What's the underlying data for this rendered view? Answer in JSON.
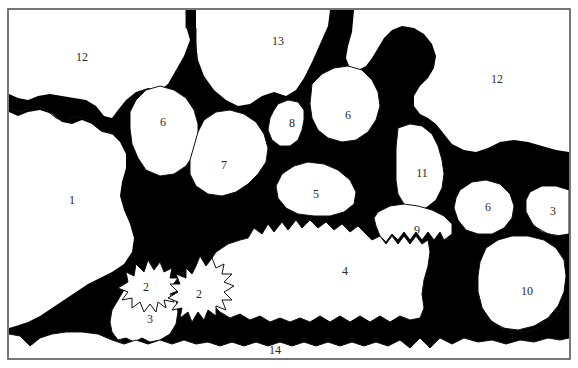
{
  "figure": {
    "width": 578,
    "height": 368,
    "colors": {
      "matrix": "#000000",
      "clast": "#ffffff",
      "outline": "#111111",
      "frame": "#555555",
      "label": "#2a2a2a"
    }
  },
  "frame": {
    "x": 8,
    "y": 9,
    "width": 562,
    "height": 350
  },
  "labels": [
    {
      "id": "label-12-left",
      "text": "12",
      "x": 82,
      "y": 58
    },
    {
      "id": "label-13",
      "text": "13",
      "x": 278,
      "y": 42
    },
    {
      "id": "label-12-right",
      "text": "12",
      "x": 497,
      "y": 80
    },
    {
      "id": "label-6-upper-left",
      "text": "6",
      "x": 163,
      "y": 123
    },
    {
      "id": "label-8",
      "text": "8",
      "x": 292,
      "y": 124
    },
    {
      "id": "label-6-upper-right",
      "text": "6",
      "x": 348,
      "y": 116
    },
    {
      "id": "label-7",
      "text": "7",
      "x": 224,
      "y": 166
    },
    {
      "id": "label-11",
      "text": "11",
      "x": 422,
      "y": 174
    },
    {
      "id": "label-1",
      "text": "1",
      "x": 72,
      "y": 201
    },
    {
      "id": "label-5",
      "text": "5",
      "x": 316,
      "y": 195
    },
    {
      "id": "label-6-right",
      "text": "6",
      "x": 488,
      "y": 208
    },
    {
      "id": "label-3-right",
      "text": "3",
      "x": 553,
      "y": 212
    },
    {
      "id": "label-9",
      "text": "9",
      "x": 417,
      "y": 231
    },
    {
      "id": "label-4",
      "text": "4",
      "x": 345,
      "y": 272
    },
    {
      "id": "label-2-left",
      "text": "2",
      "x": 146,
      "y": 288
    },
    {
      "id": "label-2-right",
      "text": "2",
      "x": 199,
      "y": 295
    },
    {
      "id": "label-10",
      "text": "10",
      "x": 527,
      "y": 292
    },
    {
      "id": "label-3-left",
      "text": "3",
      "x": 150,
      "y": 320
    },
    {
      "id": "label-14",
      "text": "14",
      "x": 275,
      "y": 351
    }
  ]
}
